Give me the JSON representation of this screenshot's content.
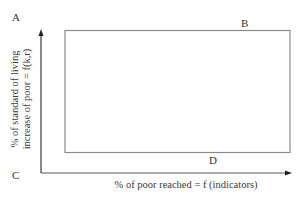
{
  "diagram": {
    "type": "quadrant-box",
    "corner_labels": {
      "A": "A",
      "B": "B",
      "C": "C",
      "D": "D"
    },
    "x_axis": {
      "label": "% of poor reached = f (indicators)"
    },
    "y_axis": {
      "label_line1": "% of standard of living",
      "label_line2": "increase of poor = f(k,r)"
    },
    "colors": {
      "axis": "#3a3a3a",
      "box": "#8a8a8a",
      "text": "#333333",
      "background": "#ffffff"
    }
  }
}
